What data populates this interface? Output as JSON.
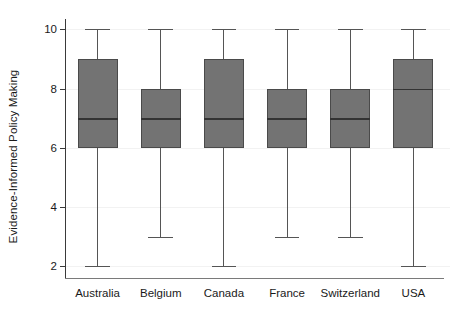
{
  "chart_data": {
    "type": "box",
    "title": "",
    "subtitle": "",
    "xlabel": "",
    "ylabel": "Evidence-Informed Policy Making",
    "ylim": [
      1.6,
      10.35
    ],
    "yticks": [
      2,
      4,
      6,
      8,
      10
    ],
    "ytick_labels": [
      "2",
      "4",
      "6",
      "8",
      "10"
    ],
    "grid": "horizontal-faint",
    "legend": "none",
    "categories": [
      "Australia",
      "Belgium",
      "Canada",
      "France",
      "Switzerland",
      "USA"
    ],
    "series": [
      {
        "name": "Evidence-Informed Policy Making",
        "boxes": [
          {
            "category": "Australia",
            "whisker_low": 2,
            "q1": 6,
            "median": 7,
            "q3": 9,
            "whisker_high": 10
          },
          {
            "category": "Belgium",
            "whisker_low": 3,
            "q1": 6,
            "median": 7,
            "q3": 8,
            "whisker_high": 10
          },
          {
            "category": "Canada",
            "whisker_low": 2,
            "q1": 6,
            "median": 7,
            "q3": 9,
            "whisker_high": 10
          },
          {
            "category": "France",
            "whisker_low": 3,
            "q1": 6,
            "median": 7,
            "q3": 8,
            "whisker_high": 10
          },
          {
            "category": "Switzerland",
            "whisker_low": 3,
            "q1": 6,
            "median": 7,
            "q3": 8,
            "whisker_high": 10
          },
          {
            "category": "USA",
            "whisker_low": 2,
            "q1": 6,
            "median": 8,
            "q3": 9,
            "whisker_high": 10
          }
        ]
      }
    ],
    "colors": {
      "box_fill": "#737373",
      "box_border": "#4a4a4a",
      "median": "#333333",
      "whisker": "#555555",
      "axis": "#3a3a3a",
      "gridline": "#f2f2f2",
      "background": "#ffffff",
      "text": "#1a1a1a"
    }
  }
}
